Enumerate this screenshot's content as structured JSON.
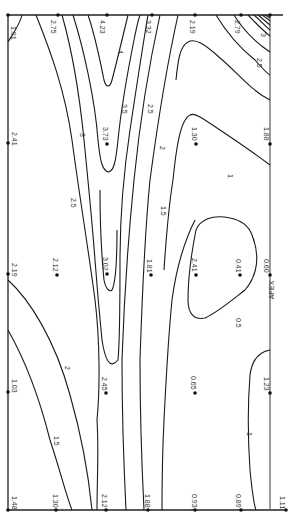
{
  "diagram": {
    "type": "contour-map",
    "orientation": "rotated-90",
    "axis_label": "APEX",
    "contour_levels": [
      "1",
      "1.5",
      "2",
      "2.5",
      "3",
      "3.5",
      "4"
    ],
    "contour_labels": [
      {
        "text": "4",
        "x": 118,
        "y": 50
      },
      {
        "text": "3.5",
        "x": 122,
        "y": 108
      },
      {
        "text": "3",
        "x": 80,
        "y": 137
      },
      {
        "text": "2.5",
        "x": 148,
        "y": 110
      },
      {
        "text": "2.5",
        "x": 72,
        "y": 203
      },
      {
        "text": "2",
        "x": 161,
        "y": 147
      },
      {
        "text": "1.5",
        "x": 162,
        "y": 212
      },
      {
        "text": "1",
        "x": 229,
        "y": 177
      },
      {
        "text": "2.5",
        "x": 257,
        "y": 64
      },
      {
        "text": "3",
        "x": 262,
        "y": 36
      },
      {
        "text": "3",
        "x": 110,
        "y": 24
      },
      {
        "text": "2",
        "x": 66,
        "y": 368
      },
      {
        "text": "1.5",
        "x": 56,
        "y": 441
      },
      {
        "text": "0.5",
        "x": 237,
        "y": 323
      },
      {
        "text": "1",
        "x": 248,
        "y": 434
      }
    ],
    "data_points": [
      {
        "value": "1.91",
        "x": 8,
        "y": 15
      },
      {
        "value": "2.75",
        "x": 58,
        "y": 15
      },
      {
        "value": "4.23",
        "x": 107,
        "y": 15
      },
      {
        "value": "3.32",
        "x": 152,
        "y": 15
      },
      {
        "value": "2.19",
        "x": 195,
        "y": 15
      },
      {
        "value": "2.79",
        "x": 241,
        "y": 15
      },
      {
        "value": "5.75",
        "x": 268,
        "y": 15
      },
      {
        "value": "2.41",
        "x": 8,
        "y": 143
      },
      {
        "value": "3.73",
        "x": 107,
        "y": 144
      },
      {
        "value": "1.30",
        "x": 196,
        "y": 144
      },
      {
        "value": "1.88",
        "x": 268,
        "y": 144
      },
      {
        "value": "2.19",
        "x": 8,
        "y": 274
      },
      {
        "value": "2.12",
        "x": 57,
        "y": 275
      },
      {
        "value": "3.02",
        "x": 107,
        "y": 274
      },
      {
        "value": "1.81",
        "x": 151,
        "y": 275
      },
      {
        "value": "2.41",
        "x": 196,
        "y": 275
      },
      {
        "value": "0.41",
        "x": 240,
        "y": 275
      },
      {
        "value": "0.60",
        "x": 268,
        "y": 275
      },
      {
        "value": "1.03",
        "x": 8,
        "y": 392
      },
      {
        "value": "2.45",
        "x": 106,
        "y": 393
      },
      {
        "value": "0.65",
        "x": 195,
        "y": 393
      },
      {
        "value": "1.23",
        "x": 268,
        "y": 393
      },
      {
        "value": "1.48",
        "x": 8,
        "y": 510
      },
      {
        "value": "1.30",
        "x": 56,
        "y": 510
      },
      {
        "value": "2.12",
        "x": 106,
        "y": 510
      },
      {
        "value": "1.88",
        "x": 148,
        "y": 510
      },
      {
        "value": "0.93",
        "x": 195,
        "y": 510
      },
      {
        "value": "0.89",
        "x": 241,
        "y": 510
      },
      {
        "value": "1.11",
        "x": 286,
        "y": 510
      }
    ]
  }
}
